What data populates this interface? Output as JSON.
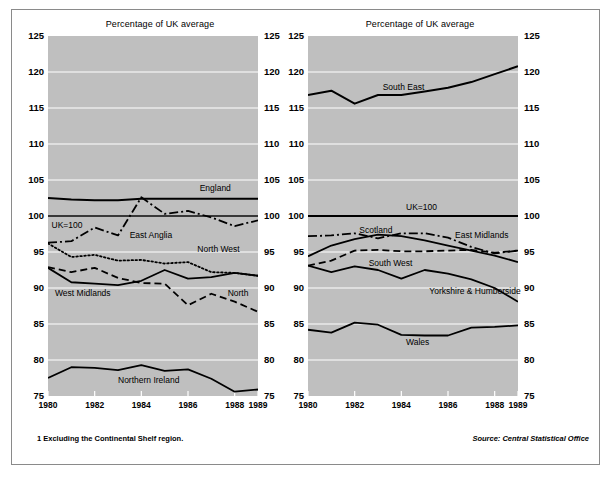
{
  "figure": {
    "footnote": "1  Excluding the Continental Shelf region.",
    "source": "Source: Central Statistical Office"
  },
  "chart_data": [
    {
      "type": "line",
      "title": "Percentage of UK average",
      "panel": "left",
      "xlabel": "",
      "ylabel": "",
      "x": [
        1980,
        1981,
        1982,
        1983,
        1984,
        1985,
        1986,
        1987,
        1988,
        1989
      ],
      "xlim": [
        1980,
        1989
      ],
      "ylim": [
        75,
        125
      ],
      "yticks": [
        75,
        80,
        85,
        90,
        95,
        100,
        105,
        110,
        115,
        120,
        125
      ],
      "xticks": [
        1980,
        1982,
        1984,
        1986,
        1988,
        1989
      ],
      "grid": true,
      "legend": "inline-labels",
      "series": [
        {
          "name": "England",
          "style": "solid",
          "width": 2.0,
          "label_x": 1986.5,
          "label_y": 103.9,
          "values": [
            102.5,
            102.3,
            102.2,
            102.2,
            102.4,
            102.4,
            102.4,
            102.4,
            102.4,
            102.4
          ]
        },
        {
          "name": "UK=100",
          "style": "solid",
          "width": 1.3,
          "label_x": 1980.15,
          "label_y": 98.8,
          "values": [
            100,
            100,
            100,
            100,
            100,
            100,
            100,
            100,
            100,
            100
          ]
        },
        {
          "name": "East Anglia",
          "style": "dashdot",
          "width": 1.8,
          "label_x": 1983.5,
          "label_y": 97.3,
          "values": [
            96.3,
            96.5,
            98.4,
            97.3,
            102.6,
            100.3,
            100.7,
            99.8,
            98.6,
            99.4
          ]
        },
        {
          "name": "North West",
          "style": "dotted",
          "width": 1.8,
          "label_x": 1986.4,
          "label_y": 95.4,
          "values": [
            96.2,
            94.3,
            94.6,
            93.8,
            93.9,
            93.4,
            93.6,
            92.2,
            92.1,
            91.7
          ]
        },
        {
          "name": "West Midlands",
          "style": "solid",
          "width": 1.8,
          "label_x": 1980.3,
          "label_y": 89.3,
          "values": [
            92.8,
            90.8,
            90.6,
            90.4,
            91.0,
            92.5,
            91.3,
            91.5,
            92.1,
            91.7
          ]
        },
        {
          "name": "North",
          "style": "dashed",
          "width": 1.8,
          "label_x": 1987.7,
          "label_y": 89.3,
          "values": [
            92.9,
            92.2,
            92.8,
            91.4,
            90.7,
            90.6,
            87.6,
            89.2,
            88.1,
            86.7
          ]
        },
        {
          "name": "Northern Ireland",
          "style": "solid",
          "width": 1.8,
          "label_x": 1983.0,
          "label_y": 77.2,
          "values": [
            77.5,
            79.0,
            78.9,
            78.6,
            79.3,
            78.5,
            78.7,
            77.4,
            75.6,
            75.9
          ]
        }
      ]
    },
    {
      "type": "line",
      "title": "Percentage of UK average",
      "panel": "right",
      "xlabel": "",
      "ylabel": "",
      "x": [
        1980,
        1981,
        1982,
        1983,
        1984,
        1985,
        1986,
        1987,
        1988,
        1989
      ],
      "xlim": [
        1980,
        1989
      ],
      "ylim": [
        75,
        125
      ],
      "yticks": [
        75,
        80,
        85,
        90,
        95,
        100,
        105,
        110,
        115,
        120,
        125
      ],
      "xticks": [
        1980,
        1982,
        1984,
        1986,
        1988,
        1989
      ],
      "grid": true,
      "legend": "inline-labels",
      "series": [
        {
          "name": "South East",
          "style": "solid",
          "width": 2.0,
          "label_x": 1983.2,
          "label_y": 117.9,
          "values": [
            116.8,
            117.4,
            115.6,
            116.8,
            116.8,
            117.3,
            117.8,
            118.6,
            119.7,
            120.8
          ]
        },
        {
          "name": "UK=100",
          "style": "solid",
          "width": 2.0,
          "label_x": 1984.2,
          "label_y": 101.2,
          "values": [
            100,
            100,
            100,
            100,
            100,
            100,
            100,
            100,
            100,
            100
          ]
        },
        {
          "name": "Scotland",
          "style": "solid",
          "width": 1.8,
          "label_x": 1982.2,
          "label_y": 98.1,
          "values": [
            94.4,
            95.9,
            96.8,
            97.4,
            97.2,
            96.6,
            95.9,
            95.2,
            94.5,
            93.6
          ]
        },
        {
          "name": "East Midlands",
          "style": "dashdot",
          "width": 1.8,
          "label_x": 1986.3,
          "label_y": 97.4,
          "values": [
            97.2,
            97.3,
            97.6,
            96.9,
            97.6,
            97.6,
            97.0,
            95.7,
            94.8,
            95.2
          ]
        },
        {
          "name": "South West",
          "style": "dashed",
          "width": 1.8,
          "label_x": 1982.6,
          "label_y": 93.5,
          "values": [
            93.1,
            93.8,
            95.2,
            95.3,
            95.1,
            95.1,
            95.2,
            95.3,
            94.9,
            95.2
          ]
        },
        {
          "name": "Yorkshire & Humberside",
          "style": "solid",
          "width": 1.8,
          "label_x": 1985.2,
          "label_y": 89.6,
          "values": [
            93.1,
            92.2,
            93.0,
            92.5,
            91.3,
            92.5,
            92.0,
            91.2,
            90.0,
            88.1
          ]
        },
        {
          "name": "Wales",
          "style": "solid",
          "width": 1.8,
          "label_x": 1984.2,
          "label_y": 82.5,
          "values": [
            84.2,
            83.8,
            85.2,
            84.9,
            83.5,
            83.4,
            83.4,
            84.5,
            84.6,
            84.8
          ]
        }
      ]
    }
  ]
}
